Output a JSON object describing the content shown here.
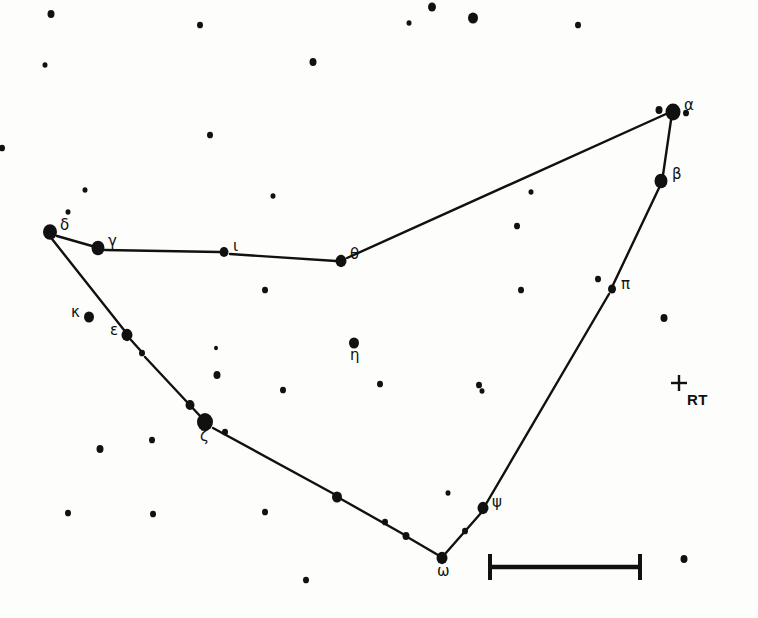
{
  "chart_title": "Constellation star chart",
  "colors": {
    "background": "#fdfdfb",
    "ink": "#111111",
    "line": "#111111"
  },
  "canvas": {
    "width": 758,
    "height": 618
  },
  "chart_data": {
    "type": "scatter",
    "subtitle": "",
    "xlabel": "",
    "ylabel": "",
    "grid": false,
    "legend": "none",
    "xlim": [
      0,
      758
    ],
    "ylim": [
      0,
      618
    ],
    "note": "Hand-drawn constellation map: filled dots are stars sized by apparent magnitude, straight segments are constellation stick-figure lines, a plus sign marks the variable star RT, and a horizontal bar gives the angular scale.",
    "named_stars": [
      {
        "label": "α",
        "name": "alpha",
        "x": 673,
        "y": 112,
        "r": 7.5,
        "label_dx": 11,
        "label_dy": -14
      },
      {
        "label": "β",
        "name": "beta",
        "x": 661,
        "y": 181,
        "r": 6.5,
        "label_dx": 11,
        "label_dy": -14
      },
      {
        "label": "γ",
        "name": "gamma",
        "x": 98,
        "y": 248,
        "r": 6.5,
        "label_dx": 10,
        "label_dy": -14
      },
      {
        "label": "δ",
        "name": "delta",
        "x": 50,
        "y": 232,
        "r": 7.0,
        "label_dx": 10,
        "label_dy": -14
      },
      {
        "label": "ε",
        "name": "epsilon",
        "x": 127,
        "y": 335,
        "r": 5.5,
        "label_dx": -17,
        "label_dy": -12
      },
      {
        "label": "ζ",
        "name": "zeta",
        "x": 205,
        "y": 422,
        "r": 8.0,
        "label_dx": -5,
        "label_dy": 7
      },
      {
        "label": "η",
        "name": "eta",
        "x": 354,
        "y": 343,
        "r": 5.0,
        "label_dx": -4,
        "label_dy": 5
      },
      {
        "label": "θ",
        "name": "theta",
        "x": 341,
        "y": 261,
        "r": 5.5,
        "label_dx": 9,
        "label_dy": -14
      },
      {
        "label": "ι",
        "name": "iota",
        "x": 224,
        "y": 252,
        "r": 4.5,
        "label_dx": 9,
        "label_dy": -13
      },
      {
        "label": "κ",
        "name": "kappa",
        "x": 89,
        "y": 317,
        "r": 5.0,
        "label_dx": -18,
        "label_dy": -12
      },
      {
        "label": "π",
        "name": "pi",
        "x": 612,
        "y": 289,
        "r": 4.0,
        "label_dx": 9,
        "label_dy": -12
      },
      {
        "label": "ψ",
        "name": "psi",
        "x": 483,
        "y": 508,
        "r": 5.5,
        "label_dx": 9,
        "label_dy": -13
      },
      {
        "label": "ω",
        "name": "omega",
        "x": 442,
        "y": 558,
        "r": 5.5,
        "label_dx": -5,
        "label_dy": 6
      }
    ],
    "line_stars": [
      {
        "name": "alpha-companion",
        "x": 659,
        "y": 110,
        "r": 3.5
      },
      {
        "name": "theta-alpha-mid",
        "x": 531,
        "y": 192,
        "r": 2.5
      },
      {
        "name": "epsilon-zeta-a",
        "x": 142,
        "y": 353,
        "r": 3.0
      },
      {
        "name": "epsilon-zeta-b",
        "x": 190,
        "y": 405,
        "r": 4.5
      },
      {
        "name": "zeta-omega-a",
        "x": 337,
        "y": 497,
        "r": 5.0
      },
      {
        "name": "zeta-omega-b",
        "x": 406,
        "y": 536,
        "r": 3.5
      },
      {
        "name": "omega-psi-mid",
        "x": 465,
        "y": 531,
        "r": 3.0
      }
    ],
    "field_stars": [
      {
        "x": 51,
        "y": 14,
        "r": 3.5
      },
      {
        "x": 200,
        "y": 25,
        "r": 3.0
      },
      {
        "x": 432,
        "y": 7,
        "r": 4.0
      },
      {
        "x": 409,
        "y": 23,
        "r": 2.5
      },
      {
        "x": 473,
        "y": 18,
        "r": 5.0
      },
      {
        "x": 578,
        "y": 25,
        "r": 3.0
      },
      {
        "x": 45,
        "y": 65,
        "r": 2.5
      },
      {
        "x": 313,
        "y": 62,
        "r": 3.5
      },
      {
        "x": 686,
        "y": 113,
        "r": 3.0
      },
      {
        "x": 210,
        "y": 135,
        "r": 3.0
      },
      {
        "x": 2,
        "y": 148,
        "r": 3.0
      },
      {
        "x": 85,
        "y": 190,
        "r": 2.5
      },
      {
        "x": 68,
        "y": 212,
        "r": 2.5
      },
      {
        "x": 273,
        "y": 196,
        "r": 2.5
      },
      {
        "x": 517,
        "y": 226,
        "r": 3.0
      },
      {
        "x": 265,
        "y": 290,
        "r": 3.0
      },
      {
        "x": 521,
        "y": 290,
        "r": 3.0
      },
      {
        "x": 598,
        "y": 279,
        "r": 3.0
      },
      {
        "x": 664,
        "y": 318,
        "r": 3.5
      },
      {
        "x": 216,
        "y": 348,
        "r": 2.0
      },
      {
        "x": 217,
        "y": 375,
        "r": 3.5
      },
      {
        "x": 283,
        "y": 390,
        "r": 3.0
      },
      {
        "x": 380,
        "y": 384,
        "r": 3.0
      },
      {
        "x": 479,
        "y": 385,
        "r": 3.0
      },
      {
        "x": 482,
        "y": 391,
        "r": 2.5
      },
      {
        "x": 100,
        "y": 449,
        "r": 3.5
      },
      {
        "x": 152,
        "y": 440,
        "r": 3.0
      },
      {
        "x": 225,
        "y": 432,
        "r": 3.0
      },
      {
        "x": 68,
        "y": 513,
        "r": 3.0
      },
      {
        "x": 153,
        "y": 514,
        "r": 3.0
      },
      {
        "x": 265,
        "y": 512,
        "r": 3.0
      },
      {
        "x": 385,
        "y": 522,
        "r": 3.0
      },
      {
        "x": 306,
        "y": 580,
        "r": 3.0
      },
      {
        "x": 448,
        "y": 493,
        "r": 2.5
      },
      {
        "x": 684,
        "y": 559,
        "r": 3.5
      }
    ],
    "constellation_lines": [
      {
        "from": "delta",
        "to": "gamma",
        "x1": 57,
        "y1": 236,
        "x2": 92,
        "y2": 246
      },
      {
        "from": "gamma",
        "to": "iota",
        "x1": 105,
        "y1": 250,
        "x2": 219,
        "y2": 252
      },
      {
        "from": "iota",
        "to": "theta",
        "x1": 230,
        "y1": 254,
        "x2": 336,
        "y2": 261
      },
      {
        "from": "theta",
        "to": "alpha",
        "x1": 347,
        "y1": 258,
        "x2": 666,
        "y2": 114
      },
      {
        "from": "alpha",
        "to": "beta",
        "x1": 671,
        "y1": 120,
        "x2": 663,
        "y2": 175
      },
      {
        "from": "beta",
        "to": "pi",
        "x1": 659,
        "y1": 188,
        "x2": 613,
        "y2": 285
      },
      {
        "from": "pi",
        "to": "psi",
        "x1": 609,
        "y1": 294,
        "x2": 486,
        "y2": 504
      },
      {
        "from": "delta",
        "to": "epsilon",
        "x1": 52,
        "y1": 239,
        "x2": 124,
        "y2": 330
      },
      {
        "from": "epsilon",
        "to": "epsilon-zeta-a",
        "x1": 131,
        "y1": 340,
        "x2": 140,
        "y2": 350
      },
      {
        "from": "epsilon-zeta-a",
        "to": "zeta",
        "x1": 145,
        "y1": 357,
        "x2": 201,
        "y2": 417
      },
      {
        "from": "zeta",
        "to": "zeta-omega-a",
        "x1": 213,
        "y1": 428,
        "x2": 334,
        "y2": 494
      },
      {
        "from": "zeta-omega-a",
        "to": "zeta-omega-b",
        "x1": 341,
        "y1": 499,
        "x2": 403,
        "y2": 534
      },
      {
        "from": "zeta-omega-b",
        "to": "omega",
        "x1": 409,
        "y1": 538,
        "x2": 438,
        "y2": 555
      },
      {
        "from": "omega",
        "to": "psi",
        "x1": 445,
        "y1": 554,
        "x2": 481,
        "y2": 513
      }
    ],
    "variable_star_marker": {
      "symbol": "+",
      "label": "RT",
      "x": 679,
      "y": 383,
      "label_dx": 8,
      "label_dy": 8
    },
    "scale_bar": {
      "x1": 490,
      "x2": 640,
      "y": 567,
      "cap_height": 26,
      "caption": ""
    }
  }
}
